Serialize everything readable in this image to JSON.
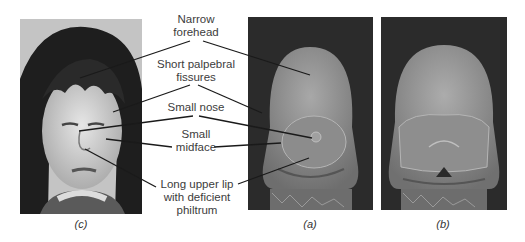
{
  "figure": {
    "panels": [
      {
        "id": "c",
        "caption": "(c)",
        "description": "photograph of child"
      },
      {
        "id": "a",
        "caption": "(a)",
        "description": "SEM image of embryo face, affected"
      },
      {
        "id": "b",
        "caption": "(b)",
        "description": "SEM image of embryo face, control"
      }
    ],
    "labels": [
      {
        "id": "forehead",
        "line1": "Narrow",
        "line2": "forehead"
      },
      {
        "id": "palpebral",
        "line1": "Short palpebral",
        "line2": "fissures"
      },
      {
        "id": "nose",
        "line1": "Small nose"
      },
      {
        "id": "midface",
        "line1": "Small",
        "line2": "midface"
      },
      {
        "id": "lip",
        "line1": "Long upper lip",
        "line2": "with deficient",
        "line3": "philtrum"
      }
    ],
    "colors": {
      "line": "#1a1a1a",
      "text": "#3c3c3c",
      "sem_bg": "#2a2a2a",
      "sem_face": "#8f8f8f"
    }
  }
}
